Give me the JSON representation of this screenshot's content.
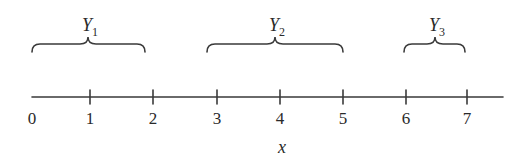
{
  "diagram": {
    "type": "number-line-with-braces",
    "axis": {
      "label": "x",
      "x_start_px": 32,
      "x_end_px": 503,
      "y_px": 97,
      "ticks": [
        {
          "value": "0",
          "x": 32,
          "mark": false
        },
        {
          "value": "1",
          "x": 90,
          "mark": true
        },
        {
          "value": "2",
          "x": 153,
          "mark": true
        },
        {
          "value": "3",
          "x": 217,
          "mark": true
        },
        {
          "value": "4",
          "x": 280,
          "mark": true
        },
        {
          "value": "5",
          "x": 343,
          "mark": true
        },
        {
          "value": "6",
          "x": 406,
          "mark": true
        },
        {
          "value": "7",
          "x": 467,
          "mark": true
        }
      ]
    },
    "braces": [
      {
        "name": "Y",
        "subscript": "1",
        "x1": 32,
        "x2": 145,
        "cusp": 88
      },
      {
        "name": "Y",
        "subscript": "2",
        "x1": 207,
        "x2": 343,
        "cusp": 275
      },
      {
        "name": "Y",
        "subscript": "3",
        "x1": 404,
        "x2": 465,
        "cusp": 435
      }
    ],
    "colors": {
      "line": "#3a3a3a",
      "text": "#2a2a2a",
      "background": "#ffffff"
    }
  }
}
